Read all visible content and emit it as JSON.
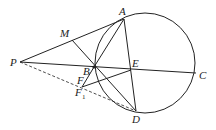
{
  "diagram": {
    "labels": {
      "A": "A",
      "M": "M",
      "P": "P",
      "B": "B",
      "E": "E",
      "C": "C",
      "F": "F",
      "F1": "F",
      "F1_sub": "1",
      "D": "D"
    },
    "points": {
      "P": [
        20,
        62
      ],
      "M": [
        72,
        40
      ],
      "A": [
        124,
        19
      ],
      "B": [
        94,
        67
      ],
      "E": [
        131,
        70
      ],
      "C": [
        196,
        73
      ],
      "D": [
        136,
        111
      ],
      "F": [
        86,
        80
      ],
      "F1": [
        82,
        87
      ]
    },
    "circle": {
      "cx": 145,
      "cy": 63,
      "r": 50
    },
    "colors": {
      "stroke": "#222222",
      "background": "#ffffff"
    }
  }
}
